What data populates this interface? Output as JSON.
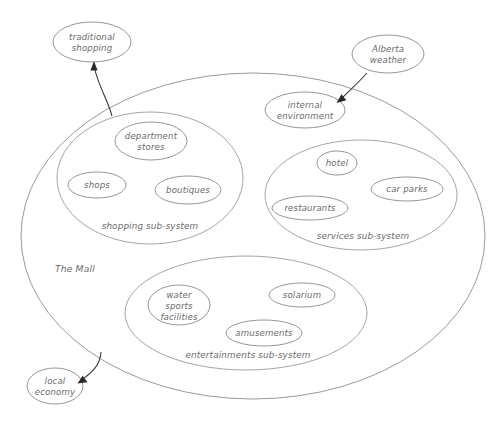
{
  "diagram": {
    "stroke_color": "#8a8a8a",
    "text_color": "#6b6b6b",
    "arrow_color": "#2a2a2a",
    "background": "#ffffff",
    "container": {
      "label": "The Mall",
      "label_x": 55,
      "label_y": 269,
      "cx": 253,
      "cy": 236,
      "rx": 232,
      "ry": 163
    },
    "external_nodes": [
      {
        "id": "traditional-shopping",
        "label_line1": "traditional",
        "label_line2": "shopping",
        "cx": 92,
        "cy": 42,
        "rx": 39,
        "ry": 20
      },
      {
        "id": "alberta-weather",
        "label_line1": "Alberta",
        "label_line2": "weather",
        "cx": 388,
        "cy": 54,
        "rx": 36,
        "ry": 19
      },
      {
        "id": "internal-environment",
        "label_line1": "internal",
        "label_line2": "environment",
        "cx": 305,
        "cy": 110,
        "rx": 40,
        "ry": 18
      },
      {
        "id": "local-economy",
        "label_line1": "local",
        "label_line2": "economy",
        "cx": 55,
        "cy": 386,
        "rx": 28,
        "ry": 18
      }
    ],
    "subsystems": [
      {
        "id": "shopping-sub-system",
        "label": "shopping sub-system",
        "cx": 150,
        "cy": 178,
        "rx": 93,
        "ry": 66,
        "label_x": 150,
        "label_y": 226,
        "nodes": [
          {
            "id": "department-stores",
            "label_line1": "department",
            "label_line2": "stores",
            "cx": 151,
            "cy": 141,
            "rx": 36,
            "ry": 19
          },
          {
            "id": "shops",
            "label_line1": "shops",
            "label_line2": "",
            "cx": 97,
            "cy": 185,
            "rx": 29,
            "ry": 13
          },
          {
            "id": "boutiques",
            "label_line1": "boutiques",
            "label_line2": "",
            "cx": 188,
            "cy": 190,
            "rx": 33,
            "ry": 14
          }
        ]
      },
      {
        "id": "services-sub-system",
        "label": "services sub-system",
        "cx": 361,
        "cy": 195,
        "rx": 96,
        "ry": 55,
        "label_x": 363,
        "label_y": 236,
        "nodes": [
          {
            "id": "hotel",
            "label_line1": "hotel",
            "label_line2": "",
            "cx": 337,
            "cy": 163,
            "rx": 20,
            "ry": 12
          },
          {
            "id": "car-parks",
            "label_line1": "car parks",
            "label_line2": "",
            "cx": 407,
            "cy": 189,
            "rx": 36,
            "ry": 12
          },
          {
            "id": "restaurants",
            "label_line1": "restaurants",
            "label_line2": "",
            "cx": 310,
            "cy": 208,
            "rx": 38,
            "ry": 12
          }
        ]
      },
      {
        "id": "entertainments-sub-system",
        "label": "entertainments sub-system",
        "cx": 246,
        "cy": 313,
        "rx": 121,
        "ry": 57,
        "label_x": 248,
        "label_y": 355,
        "nodes": [
          {
            "id": "water-sports-facilities",
            "label_line1": "water",
            "label_line2": "sports",
            "label_line3": "facilities",
            "cx": 179,
            "cy": 305,
            "rx": 31,
            "ry": 20
          },
          {
            "id": "solarium",
            "label_line1": "solarium",
            "label_line2": "",
            "cx": 302,
            "cy": 295,
            "rx": 33,
            "ry": 12
          },
          {
            "id": "amusements",
            "label_line1": "amusements",
            "label_line2": "",
            "cx": 264,
            "cy": 333,
            "rx": 38,
            "ry": 13
          }
        ]
      }
    ],
    "connectors": [
      {
        "id": "arrow-to-traditional-shopping",
        "from": "the-mall",
        "to": "traditional-shopping",
        "path": "M 112,116 C 108,100 98,86 94,66",
        "arrow_points": "94,61 90.4,70.2 97.6,70.2"
      },
      {
        "id": "arrow-alberta-weather-to-internal-environment",
        "from": "alberta-weather",
        "to": "internal-environment",
        "path": "M 367,73 C 359,82 350,90 341,99",
        "arrow_points": "336,103 345.6,100.6 341.6,94.6"
      },
      {
        "id": "arrow-to-local-economy",
        "from": "the-mall",
        "to": "local-economy",
        "path": "M 101,352 C 99,366 91,372 82,380",
        "arrow_points": "77,384 86.6,382.4 82.8,376.2"
      }
    ]
  }
}
